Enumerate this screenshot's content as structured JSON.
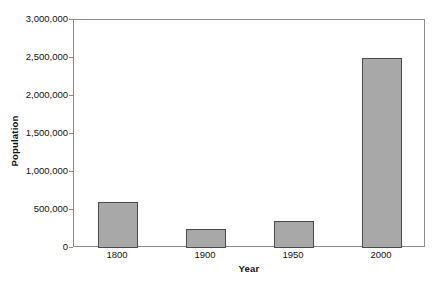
{
  "chart_data": {
    "type": "bar",
    "title": "",
    "xlabel": "Year",
    "ylabel": "Population",
    "categories": [
      "1800",
      "1900",
      "1950",
      "2000"
    ],
    "values": [
      600000,
      250000,
      350000,
      2500000
    ],
    "ylim": [
      0,
      3000000
    ],
    "ytick_labels": [
      "3,000,000",
      "2,500,000",
      "2,000,000",
      "1,500,000",
      "1,000,000",
      "500,000",
      "0"
    ],
    "ytick_values": [
      3000000,
      2500000,
      2000000,
      1500000,
      1000000,
      500000,
      0
    ],
    "grid": false,
    "legend": false,
    "bar_color": "#a8a8a8",
    "bar_edge_color": "#4a4a4a",
    "axis_color": "#8a8a8a",
    "background": "#ffffff"
  }
}
